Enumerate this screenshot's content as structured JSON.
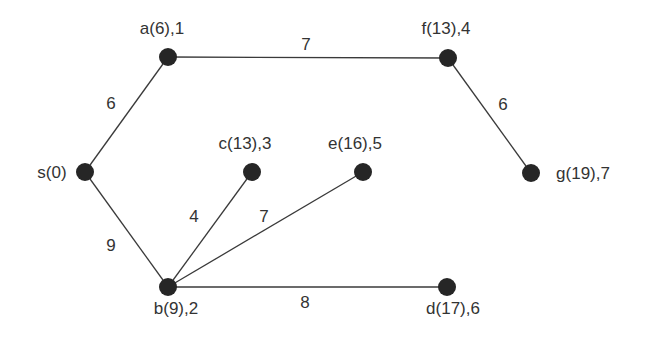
{
  "diagram": {
    "type": "weighted-graph",
    "nodes": [
      {
        "id": "s",
        "label": "s(0)",
        "x": 85,
        "y": 172,
        "lx": 52,
        "ly": 178,
        "anchor": "middle"
      },
      {
        "id": "a",
        "label": "a(6),1",
        "x": 168,
        "y": 57,
        "lx": 162,
        "ly": 34,
        "anchor": "middle"
      },
      {
        "id": "f",
        "label": "f(13),4",
        "x": 448,
        "y": 58,
        "lx": 446,
        "ly": 34,
        "anchor": "middle"
      },
      {
        "id": "g",
        "label": "g(19),7",
        "x": 531,
        "y": 173,
        "lx": 583,
        "ly": 179,
        "anchor": "middle"
      },
      {
        "id": "c",
        "label": "c(13),3",
        "x": 252,
        "y": 172,
        "lx": 245,
        "ly": 149,
        "anchor": "middle"
      },
      {
        "id": "e",
        "label": "e(16),5",
        "x": 363,
        "y": 172,
        "lx": 355,
        "ly": 149,
        "anchor": "middle"
      },
      {
        "id": "b",
        "label": "b(9),2",
        "x": 168,
        "y": 287,
        "lx": 176,
        "ly": 314,
        "anchor": "middle"
      },
      {
        "id": "d",
        "label": "d(17),6",
        "x": 447,
        "y": 287,
        "lx": 453,
        "ly": 314,
        "anchor": "middle"
      }
    ],
    "edges": [
      {
        "from": "s",
        "to": "a",
        "weight": "6",
        "lx": 111,
        "ly": 109
      },
      {
        "from": "a",
        "to": "f",
        "weight": "7",
        "lx": 306,
        "ly": 50
      },
      {
        "from": "f",
        "to": "g",
        "weight": "6",
        "lx": 503,
        "ly": 110
      },
      {
        "from": "s",
        "to": "b",
        "weight": "9",
        "lx": 111,
        "ly": 251
      },
      {
        "from": "b",
        "to": "c",
        "weight": "4",
        "lx": 194,
        "ly": 222
      },
      {
        "from": "b",
        "to": "e",
        "weight": "7",
        "lx": 264,
        "ly": 222
      },
      {
        "from": "b",
        "to": "d",
        "weight": "8",
        "lx": 305,
        "ly": 308
      }
    ]
  }
}
